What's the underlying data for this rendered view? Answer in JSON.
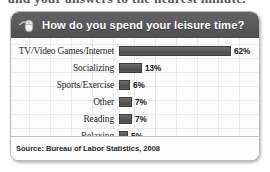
{
  "page": {
    "cut_off_heading": "and your answers to the nearest minute."
  },
  "panel": {
    "header": {
      "icon": "computer-mouse-icon",
      "title": "How do you spend your leisure time?"
    },
    "footer": {
      "source": "Source: Bureau of Labor Statistics, 2008"
    }
  },
  "colors": {
    "header_bg": "#57575a",
    "header_text": "#ffffff",
    "bar_fill": "#5a5a5c",
    "bar_border": "#3d3d3f",
    "panel_bg": "#fdfdfd",
    "grid_line": "#8a9cb8",
    "label_text": "#262626"
  },
  "chart_data": {
    "type": "bar",
    "title": "How do you spend your leisure time?",
    "orientation": "horizontal",
    "xlabel": "",
    "ylabel": "",
    "xlim": [
      0,
      62
    ],
    "grid": false,
    "legend": "none",
    "source": "Source: Bureau of Labor Statistics, 2008",
    "unit": "%",
    "categories": [
      "TV/Video Games/Internet",
      "Socializing",
      "Sports/Exercise",
      "Other",
      "Reading",
      "Relaxing"
    ],
    "values": [
      62,
      13,
      6,
      7,
      7,
      5
    ],
    "value_labels": [
      "62%",
      "13%",
      "6%",
      "7%",
      "7%",
      "5%"
    ],
    "rows": [
      {
        "label": "TV/Video Games/Internet",
        "value": 62,
        "value_label": "62%"
      },
      {
        "label": "Socializing",
        "value": 13,
        "value_label": "13%"
      },
      {
        "label": "Sports/Exercise",
        "value": 6,
        "value_label": "6%"
      },
      {
        "label": "Other",
        "value": 7,
        "value_label": "7%"
      },
      {
        "label": "Reading",
        "value": 7,
        "value_label": "7%"
      },
      {
        "label": "Relaxing",
        "value": 5,
        "value_label": "5%"
      }
    ]
  }
}
